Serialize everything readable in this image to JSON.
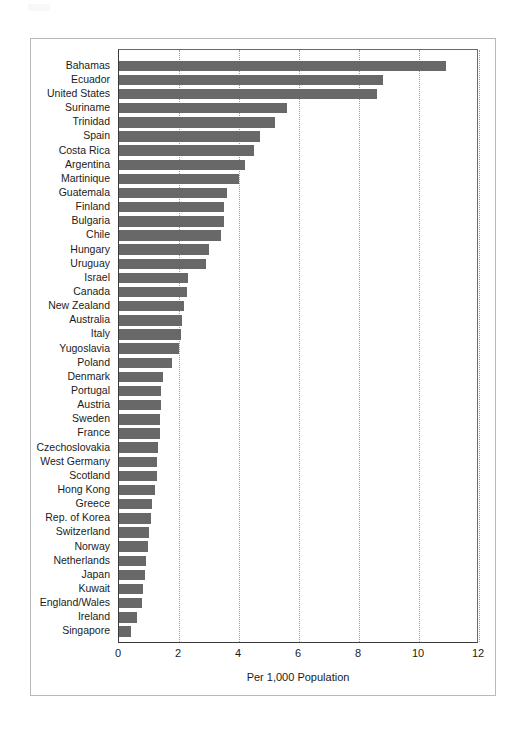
{
  "figure": {
    "frame_color": "#b9b9b9",
    "bar_color": "#686868",
    "gridline_color": "#9a9a9a"
  },
  "chart_data": {
    "type": "bar",
    "orientation": "horizontal",
    "title": "",
    "subtitle": "",
    "xlabel": "Per 1,000 Population",
    "ylabel": "",
    "xlim": [
      0,
      12
    ],
    "xticks": [
      0,
      2,
      4,
      6,
      8,
      10,
      12
    ],
    "xtick_labels": [
      "0",
      "2",
      "4",
      "6",
      "8",
      "10",
      "12"
    ],
    "grid": "vertical-dotted",
    "legend": "none",
    "categories": [
      "Bahamas",
      "Ecuador",
      "United States",
      "Suriname",
      "Trinidad",
      "Spain",
      "Costa Rica",
      "Argentina",
      "Martinique",
      "Guatemala",
      "Finland",
      "Bulgaria",
      "Chile",
      "Hungary",
      "Uruguay",
      "Israel",
      "Canada",
      "New Zealand",
      "Australia",
      "Italy",
      "Yugoslavia",
      "Poland",
      "Denmark",
      "Portugal",
      "Austria",
      "Sweden",
      "France",
      "Czechoslovakia",
      "West Germany",
      "Scotland",
      "Hong Kong",
      "Greece",
      "Rep. of Korea",
      "Switzerland",
      "Norway",
      "Netherlands",
      "Japan",
      "Kuwait",
      "England/Wales",
      "Ireland",
      "Singapore"
    ],
    "values": [
      10.9,
      8.8,
      8.6,
      5.6,
      5.2,
      4.7,
      4.5,
      4.2,
      4.0,
      3.6,
      3.5,
      3.5,
      3.4,
      3.0,
      2.9,
      2.3,
      2.25,
      2.15,
      2.1,
      2.05,
      2.0,
      1.75,
      1.45,
      1.4,
      1.4,
      1.35,
      1.35,
      1.3,
      1.25,
      1.25,
      1.2,
      1.1,
      1.05,
      1.0,
      0.95,
      0.9,
      0.85,
      0.8,
      0.75,
      0.6,
      0.4
    ]
  }
}
